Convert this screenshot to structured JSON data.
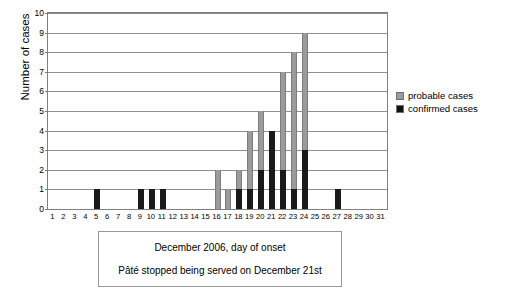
{
  "chart_data": {
    "type": "bar",
    "title": "",
    "subtitle": "",
    "xlabel": "December 2006, day of onset",
    "ylabel": "Number of cases",
    "stacked": true,
    "grid": true,
    "legend_position": "right",
    "xlim": [
      1,
      31
    ],
    "ylim": [
      0,
      10
    ],
    "ytick_values": [
      0,
      1,
      2,
      3,
      4,
      5,
      6,
      7,
      8,
      9,
      10
    ],
    "categories": [
      1,
      2,
      3,
      4,
      5,
      6,
      7,
      8,
      9,
      10,
      11,
      12,
      13,
      14,
      15,
      16,
      17,
      18,
      19,
      20,
      21,
      22,
      23,
      24,
      25,
      26,
      27,
      28,
      29,
      30,
      31
    ],
    "series": [
      {
        "name": "confirmed cases",
        "color": "#1a1a1a",
        "values": [
          0,
          0,
          0,
          0,
          1,
          0,
          0,
          0,
          1,
          1,
          1,
          0,
          0,
          0,
          0,
          0,
          0,
          1,
          1,
          2,
          4,
          2,
          1,
          3,
          0,
          0,
          1,
          0,
          0,
          0,
          0
        ]
      },
      {
        "name": "probable cases",
        "color": "#9b9b9b",
        "values": [
          0,
          0,
          0,
          0,
          0,
          0,
          0,
          0,
          0,
          0,
          0,
          0,
          0,
          0,
          0,
          2,
          1,
          1,
          3,
          3,
          0,
          5,
          7,
          6,
          0,
          0,
          0,
          0,
          0,
          0,
          0
        ]
      }
    ],
    "totals": [
      0,
      0,
      0,
      0,
      1,
      0,
      0,
      0,
      1,
      1,
      1,
      0,
      0,
      0,
      0,
      2,
      1,
      2,
      4,
      5,
      4,
      7,
      8,
      9,
      0,
      0,
      1,
      0,
      0,
      0,
      0
    ],
    "annotations": [
      "December 2006, day of onset",
      "Pâté stopped being served on December 21st"
    ]
  },
  "legend": {
    "items": [
      {
        "label": "probable cases",
        "color": "#9b9b9b"
      },
      {
        "label": "confirmed cases",
        "color": "#1a1a1a"
      }
    ]
  },
  "caption": {
    "line1": "December 2006, day of onset",
    "line2": "Pâté stopped being served on December 21st"
  },
  "axis": {
    "y_title": "Number of cases"
  }
}
